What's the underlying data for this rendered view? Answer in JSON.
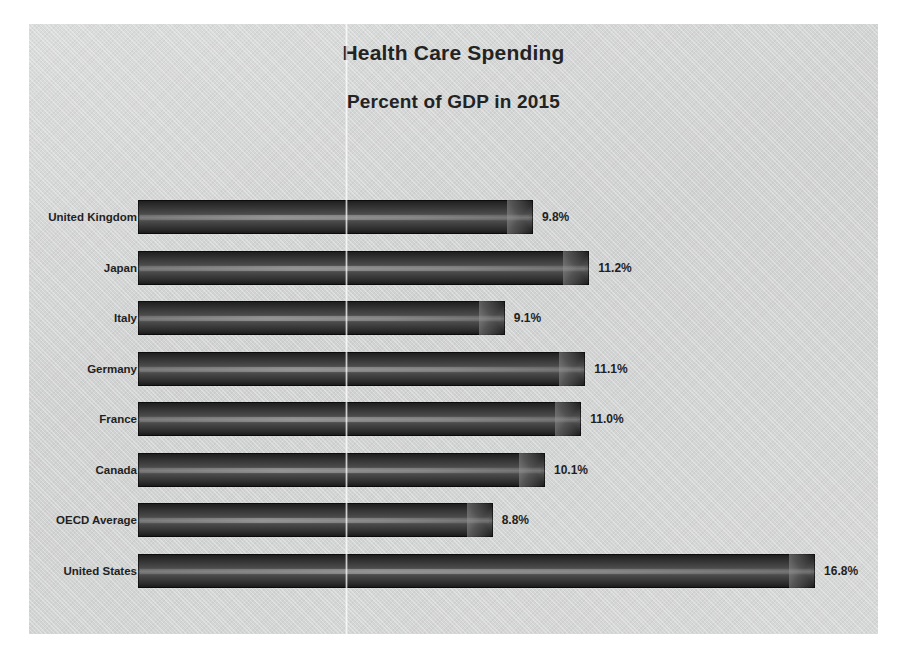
{
  "chart_data": {
    "type": "bar",
    "orientation": "horizontal",
    "title": "Health Care Spending",
    "subtitle": "Percent of GDP in 2015",
    "xlabel": "",
    "ylabel": "",
    "xlim": [
      0,
      18
    ],
    "grid": false,
    "legend": "none",
    "value_suffix": "%",
    "categories": [
      "United Kingdom",
      "Japan",
      "Italy",
      "Germany",
      "France",
      "Canada",
      "OECD Average",
      "United States"
    ],
    "values": [
      9.8,
      11.2,
      9.1,
      11.1,
      11.0,
      10.1,
      8.8,
      16.8
    ],
    "data_labels": [
      "9.8%",
      "11.2%",
      "9.1%",
      "11.1%",
      "11.0%",
      "10.1%",
      "8.8%",
      "16.8%"
    ],
    "bars": [
      {
        "category": "United Kingdom",
        "value": 9.8,
        "label": "9.8%"
      },
      {
        "category": "Japan",
        "value": 11.2,
        "label": "11.2%"
      },
      {
        "category": "Italy",
        "value": 9.1,
        "label": "9.1%"
      },
      {
        "category": "Germany",
        "value": 11.1,
        "label": "11.1%"
      },
      {
        "category": "France",
        "value": 11.0,
        "label": "11.0%"
      },
      {
        "category": "Canada",
        "value": 10.1,
        "label": "10.1%"
      },
      {
        "category": "OECD Average",
        "value": 8.8,
        "label": "8.8%"
      },
      {
        "category": "United States",
        "value": 16.8,
        "label": "16.8%"
      }
    ],
    "colors": {
      "plot_background": "#d2d3d3",
      "page_background": "#ffffff",
      "bar_dark": "#1c1c1c",
      "bar_highlight": "#6f6f6f",
      "text": "#232323"
    }
  }
}
